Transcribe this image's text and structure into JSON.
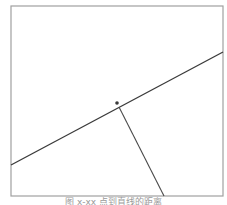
{
  "figure": {
    "frame": {
      "x": 11,
      "y": 6,
      "width": 212,
      "height": 190,
      "stroke": "#a0a0a0"
    },
    "line": {
      "x1": 11,
      "y1": 165,
      "x2": 223,
      "y2": 52,
      "stroke": "#3a3a3a"
    },
    "point": {
      "cx": 117,
      "cy": 103,
      "r": 1.8,
      "fill": "#3a3a3a"
    },
    "perpendicular": {
      "x1": 119,
      "y1": 107,
      "x2": 164,
      "y2": 196,
      "stroke": "#4a4a4a"
    },
    "caption": "图 x-xx 点到直线的距离"
  }
}
